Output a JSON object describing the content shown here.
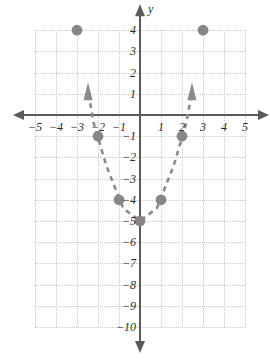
{
  "chart_data": {
    "type": "scatter",
    "title": "",
    "xlabel": "x",
    "ylabel": "y",
    "grid": true,
    "legend": "none",
    "xlim": [
      -5,
      5
    ],
    "ylim": [
      -10,
      4
    ],
    "x_ticks": [
      "-5",
      "-4",
      "-3",
      "-2",
      "-1",
      "1",
      "2",
      "3",
      "4",
      "5"
    ],
    "x_tick_values": [
      -5,
      -4,
      -3,
      -2,
      -1,
      1,
      2,
      3,
      4,
      5
    ],
    "y_ticks": [
      "4",
      "3",
      "2",
      "1",
      "-1",
      "-2",
      "-3",
      "-4",
      "-5",
      "-6",
      "-7",
      "-8",
      "-9",
      "-10"
    ],
    "y_tick_values": [
      4,
      3,
      2,
      1,
      -1,
      -2,
      -3,
      -4,
      -5,
      -6,
      -7,
      -8,
      -9,
      -10
    ],
    "points": [
      {
        "x": -3,
        "y": 4
      },
      {
        "x": -2,
        "y": -1
      },
      {
        "x": -1,
        "y": -4
      },
      {
        "x": 0,
        "y": -5
      },
      {
        "x": 1,
        "y": -4
      },
      {
        "x": 2,
        "y": -1
      },
      {
        "x": 3,
        "y": 4
      }
    ],
    "curve": {
      "style": "dashed",
      "arrows": [
        "up-left",
        "up-right"
      ],
      "equation_points": [
        {
          "x": -2.45,
          "y": 1.0
        },
        {
          "x": -2.2,
          "y": -0.4
        },
        {
          "x": -1.6,
          "y": -2.4
        },
        {
          "x": -0.8,
          "y": -4.4
        },
        {
          "x": 0,
          "y": -5
        },
        {
          "x": 0.8,
          "y": -4.4
        },
        {
          "x": 1.6,
          "y": -2.4
        },
        {
          "x": 2.2,
          "y": -0.4
        },
        {
          "x": 2.45,
          "y": 1.0
        }
      ]
    },
    "colors": {
      "point": "#878787",
      "curve": "#8a8a8a",
      "axis": "#5a5a5a",
      "grid": "#c9c9c9",
      "text": "#2b2b2b"
    }
  }
}
